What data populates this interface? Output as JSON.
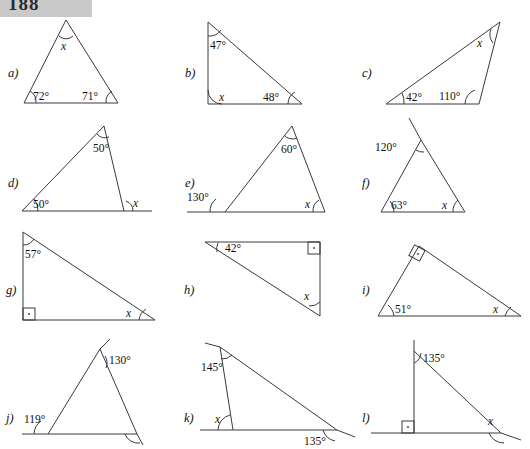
{
  "page": {
    "header_badge": "188",
    "unknown_symbol": "x",
    "degree_symbol": "°"
  },
  "problems": [
    {
      "id": "a",
      "label": "a)",
      "shape": "isosceles-triangle",
      "angles": [
        {
          "value": "72°",
          "position": "bottom-left",
          "type": "interior",
          "marker": "arc"
        },
        {
          "value": "71°",
          "position": "bottom-right",
          "type": "interior",
          "marker": "arc"
        },
        {
          "value": "x",
          "position": "apex",
          "type": "interior",
          "marker": "arc"
        }
      ]
    },
    {
      "id": "b",
      "label": "b)",
      "shape": "triangle",
      "angles": [
        {
          "value": "47°",
          "position": "top-left",
          "type": "interior",
          "marker": "arc"
        },
        {
          "value": "x",
          "position": "bottom-left",
          "type": "interior",
          "marker": "arc"
        },
        {
          "value": "48°",
          "position": "bottom-right",
          "type": "interior",
          "marker": "arc"
        }
      ]
    },
    {
      "id": "c",
      "label": "c)",
      "shape": "triangle",
      "angles": [
        {
          "value": "42°",
          "position": "bottom-left",
          "type": "interior",
          "marker": "arc"
        },
        {
          "value": "110°",
          "position": "bottom-right",
          "type": "interior",
          "marker": "arc"
        },
        {
          "value": "x",
          "position": "apex",
          "type": "interior",
          "marker": "arc"
        }
      ]
    },
    {
      "id": "d",
      "label": "d)",
      "shape": "triangle-with-extended-base",
      "angles": [
        {
          "value": "50°",
          "position": "apex",
          "type": "interior",
          "marker": "arc"
        },
        {
          "value": "50°",
          "position": "bottom-left",
          "type": "interior",
          "marker": "arc"
        },
        {
          "value": "x",
          "position": "bottom-right",
          "type": "exterior",
          "marker": "arc"
        }
      ]
    },
    {
      "id": "e",
      "label": "e)",
      "shape": "triangle-with-extended-base",
      "angles": [
        {
          "value": "60°",
          "position": "apex",
          "type": "interior",
          "marker": "arc"
        },
        {
          "value": "130°",
          "position": "bottom-left",
          "type": "exterior",
          "marker": "arc"
        },
        {
          "value": "x",
          "position": "bottom-right",
          "type": "interior",
          "marker": "arc"
        }
      ]
    },
    {
      "id": "f",
      "label": "f)",
      "shape": "triangle-with-extended-side",
      "angles": [
        {
          "value": "120°",
          "position": "apex",
          "type": "exterior",
          "marker": "arc"
        },
        {
          "value": "63°",
          "position": "bottom-left",
          "type": "interior",
          "marker": "arc"
        },
        {
          "value": "x",
          "position": "bottom-right",
          "type": "interior",
          "marker": "arc"
        }
      ]
    },
    {
      "id": "g",
      "label": "g)",
      "shape": "right-triangle",
      "angles": [
        {
          "value": "57°",
          "position": "top-left",
          "type": "interior",
          "marker": "arc"
        },
        {
          "value": "",
          "position": "bottom-left",
          "type": "right-angle",
          "marker": "square"
        },
        {
          "value": "x",
          "position": "bottom-right",
          "type": "interior",
          "marker": "arc"
        }
      ]
    },
    {
      "id": "h",
      "label": "h)",
      "shape": "right-triangle",
      "angles": [
        {
          "value": "42°",
          "position": "top-left",
          "type": "interior",
          "marker": "arc"
        },
        {
          "value": "",
          "position": "top-right",
          "type": "right-angle",
          "marker": "square"
        },
        {
          "value": "x",
          "position": "bottom-right",
          "type": "interior",
          "marker": "arc"
        }
      ]
    },
    {
      "id": "i",
      "label": "i)",
      "shape": "right-triangle",
      "angles": [
        {
          "value": "",
          "position": "apex",
          "type": "right-angle",
          "marker": "square"
        },
        {
          "value": "51°",
          "position": "bottom-left",
          "type": "interior",
          "marker": "arc"
        },
        {
          "value": "x",
          "position": "bottom-right",
          "type": "interior",
          "marker": "arc"
        }
      ]
    },
    {
      "id": "j",
      "label": "j)",
      "shape": "triangle-with-extended-sides",
      "angles": [
        {
          "value": "130°",
          "position": "apex",
          "type": "exterior",
          "marker": "arc"
        },
        {
          "value": "119°",
          "position": "bottom-left",
          "type": "exterior",
          "marker": "arc"
        },
        {
          "value": "",
          "position": "bottom-right",
          "type": "exterior",
          "marker": "arc"
        }
      ]
    },
    {
      "id": "k",
      "label": "k)",
      "shape": "triangle-with-extended-sides",
      "angles": [
        {
          "value": "145°",
          "position": "top-left",
          "type": "exterior",
          "marker": "arc"
        },
        {
          "value": "x",
          "position": "bottom-left",
          "type": "interior",
          "marker": "arc"
        },
        {
          "value": "135°",
          "position": "bottom-right",
          "type": "exterior",
          "marker": "arc"
        }
      ]
    },
    {
      "id": "l",
      "label": "l)",
      "shape": "right-triangle-with-extended-sides",
      "angles": [
        {
          "value": "135°",
          "position": "apex",
          "type": "exterior",
          "marker": "arc"
        },
        {
          "value": "",
          "position": "bottom-left",
          "type": "right-angle",
          "marker": "square"
        },
        {
          "value": "x",
          "position": "bottom-right",
          "type": "exterior",
          "marker": "arc"
        }
      ]
    }
  ]
}
